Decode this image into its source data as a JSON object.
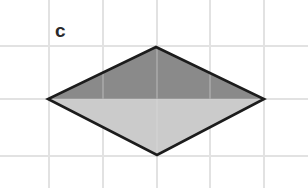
{
  "figure": {
    "panel_label": "c",
    "canvas": {
      "width": 308,
      "height": 188,
      "background": "#ffffff"
    },
    "grid": {
      "visible": true,
      "color": "#e2e2e2",
      "stroke_width": 1.4,
      "vertical_x": [
        49,
        103,
        157,
        210,
        264
      ],
      "horizontal_y": [
        46,
        99,
        156
      ]
    },
    "label_position": {
      "x": 55,
      "y": 21
    },
    "label_color": "#2a2a2a"
  },
  "chart_data": {
    "type": "diagram",
    "title": "c",
    "shape": "rhombus",
    "vertices": [
      {
        "name": "top",
        "x": 156,
        "y": 47
      },
      {
        "name": "right",
        "x": 264,
        "y": 99
      },
      {
        "name": "bottom",
        "x": 157,
        "y": 155
      },
      {
        "name": "left",
        "x": 48,
        "y": 99
      }
    ],
    "diagonals": {
      "horizontal_length": 216,
      "vertical_length": 108
    },
    "regions": [
      {
        "name": "upper-half",
        "fill": "#8a8a8a",
        "points": "156,47 264,99 48,99"
      },
      {
        "name": "lower-half",
        "fill": "#cbcbcb",
        "points": "48,99 264,99 157,155"
      }
    ],
    "outline": {
      "color": "#1c1c1c",
      "stroke_width": 2.6
    },
    "grid_spacing_px": 53.5,
    "xlabel": "",
    "ylabel": "",
    "legend": []
  }
}
